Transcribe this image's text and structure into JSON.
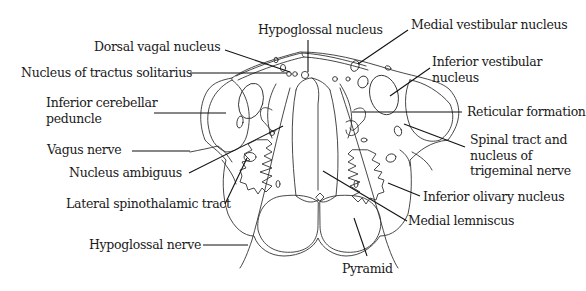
{
  "diagram": {
    "colors": {
      "stroke": "#333333",
      "leader": "#111111",
      "background": "#ffffff"
    },
    "labels": {
      "hypoglossal_nucleus": "Hypoglossal nucleus",
      "medial_vestibular_nucleus": "Medial vestibular nucleus",
      "dorsal_vagal_nucleus": "Dorsal vagal nucleus",
      "nucleus_tractus_solitarius": "Nucleus of tractus solitarius",
      "inferior_vestibular_nucleus": [
        "Inferior vestibular",
        "nucleus"
      ],
      "inferior_cerebellar_peduncle": [
        "Inferior cerebellar",
        "peduncle"
      ],
      "reticular_formation": "Reticular formation",
      "spinal_trigeminal": [
        "Spinal tract and",
        "nucleus of",
        "trigeminal nerve"
      ],
      "vagus_nerve": "Vagus nerve",
      "nucleus_ambiguus": "Nucleus ambiguus",
      "lateral_spinothalamic_tract": "Lateral spinothalamic tract",
      "inferior_olivary_nucleus": "Inferior olivary nucleus",
      "medial_lemniscus": "Medial lemniscus",
      "hypoglossal_nerve": "Hypoglossal nerve",
      "pyramid": "Pyramid"
    }
  }
}
